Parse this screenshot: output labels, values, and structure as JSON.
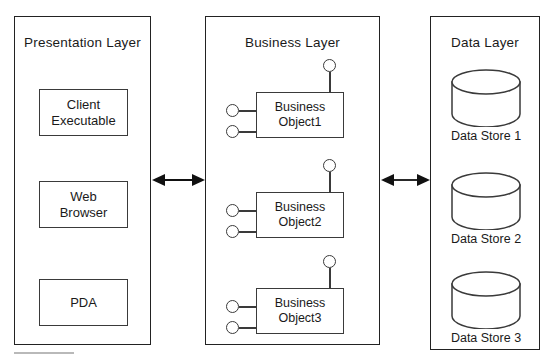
{
  "diagram": {
    "type": "layered-architecture",
    "stroke_color": "#3a3a3a",
    "background_color": "#ffffff"
  },
  "layers": [
    {
      "id": "presentation",
      "title": "Presentation Layer",
      "nodes": [
        {
          "id": "client-executable",
          "line1": "Client",
          "line2": "Executable"
        },
        {
          "id": "web-browser",
          "line1": "Web",
          "line2": "Browser"
        },
        {
          "id": "pda",
          "line1": "PDA",
          "line2": ""
        }
      ]
    },
    {
      "id": "business",
      "title": "Business Layer",
      "objects": [
        {
          "id": "business-object-1",
          "line1": "Business",
          "line2": "Object1",
          "interfaces_left": 2,
          "interfaces_top": 1
        },
        {
          "id": "business-object-2",
          "line1": "Business",
          "line2": "Object2",
          "interfaces_left": 2,
          "interfaces_top": 1
        },
        {
          "id": "business-object-3",
          "line1": "Business",
          "line2": "Object3",
          "interfaces_left": 2,
          "interfaces_top": 1
        }
      ]
    },
    {
      "id": "data",
      "title": "Data Layer",
      "stores": [
        {
          "id": "data-store-1",
          "label": "Data Store 1"
        },
        {
          "id": "data-store-2",
          "label": "Data Store 2"
        },
        {
          "id": "data-store-3",
          "label": "Data Store 3"
        }
      ]
    }
  ],
  "connectors": [
    {
      "id": "presentation-business-arrow",
      "kind": "bidirectional-arrow",
      "from": "presentation",
      "to": "business"
    },
    {
      "id": "business-data-arrow",
      "kind": "bidirectional-arrow",
      "from": "business",
      "to": "data"
    }
  ]
}
